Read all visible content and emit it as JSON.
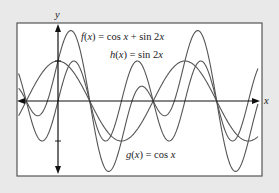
{
  "chart_data": {
    "type": "line",
    "title": "",
    "xlabel": "x",
    "ylabel": "y",
    "x_range_radians": [
      -1.95,
      9.9
    ],
    "y_range": [
      -2,
      2
    ],
    "yticks": [
      1,
      -1
    ],
    "grid": false,
    "legend_position": "inline annotations",
    "series": [
      {
        "name": "f(x) = cos x + sin 2x",
        "formula": "cos(x) + sin(2x)",
        "label_position": "top, right of y-axis"
      },
      {
        "name": "h(x) = sin 2x",
        "formula": "sin(2x)",
        "label_position": "top center"
      },
      {
        "name": "g(x) = cos x",
        "formula": "cos(x)",
        "label_position": "bottom center"
      }
    ]
  },
  "labels": {
    "x_axis": "x",
    "y_axis": "y",
    "f": "f(x) = cos x + sin 2x",
    "h": "h(x) = sin 2x",
    "g": "g(x) = cos x"
  },
  "colors": {
    "background": "#e9e9e9",
    "plot_bg": "#ffffff",
    "frame": "#555555",
    "curves": "#555555",
    "axes": "#111111"
  }
}
